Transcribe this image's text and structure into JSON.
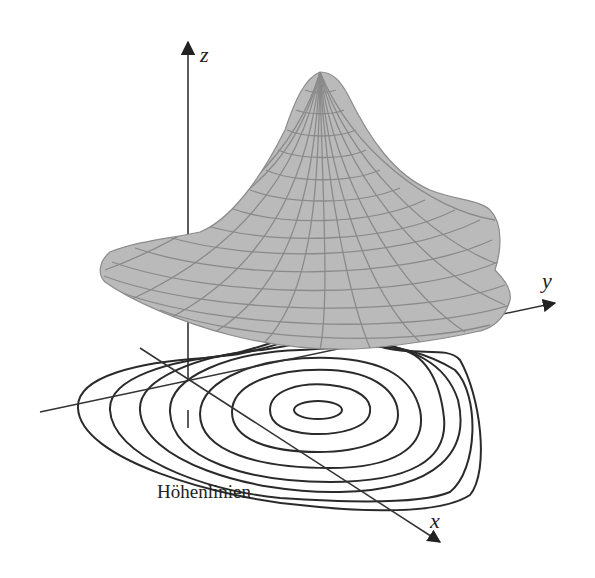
{
  "figure": {
    "type": "3d-surface-with-contours",
    "axes": {
      "x_label": "x",
      "y_label": "y",
      "z_label": "z"
    },
    "contour_label": "Höhenlinien",
    "colors": {
      "surface_fill": "#b9b9b9",
      "surface_grid": "#8a8a8a",
      "contour_line": "#2a2a2a",
      "axis_line": "#333333",
      "background": "#ffffff"
    },
    "contour_count": 8
  }
}
